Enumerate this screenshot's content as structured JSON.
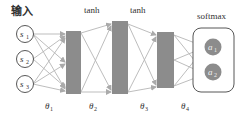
{
  "diagram": {
    "title_input": "输入",
    "layer_labels": [
      "tanh",
      "tanh",
      "softmax"
    ],
    "inputs": [
      {
        "name": "s",
        "sub": "1"
      },
      {
        "name": "s",
        "sub": "2"
      },
      {
        "name": "s",
        "sub": "3"
      }
    ],
    "outputs": [
      {
        "name": "a",
        "sub": "1"
      },
      {
        "name": "a",
        "sub": "2"
      }
    ],
    "weights": [
      {
        "name": "θ",
        "sub": "1"
      },
      {
        "name": "θ",
        "sub": "2"
      },
      {
        "name": "θ",
        "sub": "3"
      },
      {
        "name": "θ",
        "sub": "4"
      }
    ],
    "colors": {
      "layer_fill": "#8c8c8c",
      "arrow": "#b0b0b0",
      "output_fill": "#8c8c8c",
      "stroke": "#444444"
    }
  }
}
